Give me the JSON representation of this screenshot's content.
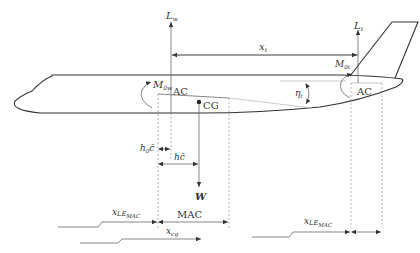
{
  "diagram": {
    "labels": {
      "wing_lift": "L",
      "wing_lift_sub": "w",
      "tail_lift": "L",
      "tail_lift_sub": "t",
      "tail_arm": "x",
      "tail_arm_sub": "t",
      "wing_moment": "M",
      "wing_moment_sub": "0w",
      "tail_moment": "M",
      "tail_moment_sub": "0t",
      "wing_ac": "AC",
      "tail_ac": "AC",
      "cg": "CG",
      "tail_incidence": "η",
      "tail_incidence_sub": "t",
      "h0c": "h",
      "h0c_sub": "0",
      "h0c_suffix": "c̄",
      "hc": "hc̄",
      "weight": "W",
      "x_le_mac_wing": "x",
      "x_le_mac_wing_sub": "LE",
      "x_le_mac_wing_subsub": "MAC",
      "mac": "MAC",
      "x_cg": "x",
      "x_cg_sub": "cg",
      "x_le_mac_tail": "x",
      "x_le_mac_tail_sub": "LE",
      "x_le_mac_tail_subsub": "MAC"
    },
    "colors": {
      "ink": "#333333",
      "dashed": "#888888",
      "faint": "#bbbbbb"
    }
  }
}
